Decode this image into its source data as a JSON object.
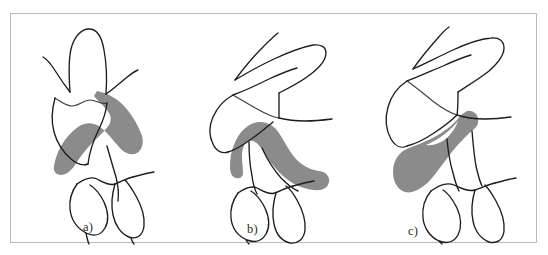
{
  "figure": {
    "kind": "line-drawing-diagram",
    "background_color": "#ffffff",
    "border_color": "#b9b9b9",
    "ink_color": "#1d1d1d",
    "shade_color": "#8b8b8b",
    "panel_count": 3,
    "panels": [
      {
        "id": "a",
        "label": "a)",
        "description": "Upright upper molar opposing lower teeth with shaded band along the mesial-distal contour",
        "shade_present": true
      },
      {
        "id": "b",
        "label": "b)",
        "description": "Strongly tipped upper molar with shaded band draped over the lower tooth crown",
        "shade_present": true
      },
      {
        "id": "c",
        "label": "c)",
        "description": "Tipped upper molar with broad shaded wedge extending to the left of the lower tooth",
        "shade_present": true
      }
    ]
  }
}
